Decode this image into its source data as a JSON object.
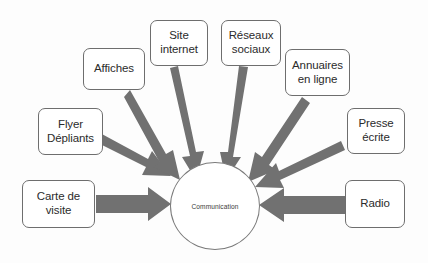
{
  "diagram": {
    "type": "converging-arrow-diagram",
    "center": {
      "label": "Communication",
      "shape": "circle"
    },
    "arrow_color": "#717171",
    "box_border_color": "#6e6e6e",
    "text_color": "#2b2b2b",
    "background_color": "#fdfdfd",
    "nodes": [
      {
        "id": "carte-de-visite",
        "label": "Carte de\nvisite"
      },
      {
        "id": "flyer-depliants",
        "label": "Flyer\nDépliants"
      },
      {
        "id": "affiches",
        "label": "Affiches"
      },
      {
        "id": "site-internet",
        "label": "Site\ninternet"
      },
      {
        "id": "reseaux-sociaux",
        "label": "Réseaux\nsociaux"
      },
      {
        "id": "annuaires-en-ligne",
        "label": "Annuaires\nen ligne"
      },
      {
        "id": "presse-ecrite",
        "label": "Presse\nécrite"
      },
      {
        "id": "radio",
        "label": "Radio"
      }
    ]
  }
}
